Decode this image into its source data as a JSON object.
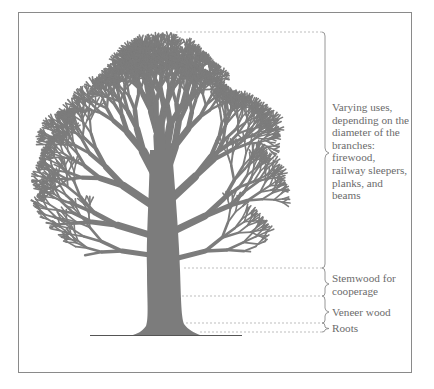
{
  "diagram": {
    "colors": {
      "tree": "#7c7c7c",
      "frame": "#8a8a8a",
      "leader": "#b5b5b5",
      "text": "#6b6b6b",
      "ground": "#555555"
    },
    "labels": [
      {
        "id": "branches",
        "text": "Varying uses,\ndepending on the\ndiameter of the\nbranches:\nfirewood,\nrailway sleepers,\nplanks, and\nbeams"
      },
      {
        "id": "stemwood",
        "text": "Stemwood for\ncooperage"
      },
      {
        "id": "veneer",
        "text": "Veneer wood"
      },
      {
        "id": "roots",
        "text": "Roots"
      }
    ]
  }
}
